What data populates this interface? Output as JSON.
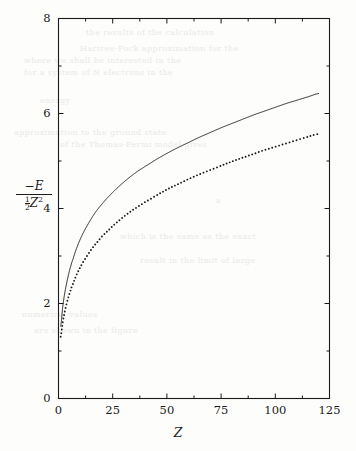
{
  "figure": {
    "background_color": "#fdfdfc",
    "ink_color": "#1a1a1a",
    "bleed_color": "#e9e9e6"
  },
  "axes": {
    "x_title": "Z",
    "y_title_numerator": "−E",
    "y_title_denominator_fraction_num": "1",
    "y_title_denominator_fraction_den": "2",
    "y_title_denominator_symbol": "Z",
    "y_title_denominator_exponent": "2",
    "x_tick_labels": [
      "0",
      "25",
      "50",
      "75",
      "100",
      "125"
    ],
    "y_tick_labels": [
      "0",
      "2",
      "4",
      "6",
      "8"
    ]
  },
  "bleed_text": [
    {
      "text": "the results of the calculation",
      "x": 86,
      "y": 28
    },
    {
      "text": "Hartree-Fock approximation for the",
      "x": 80,
      "y": 44
    },
    {
      "text": "where we shall be interested in the",
      "x": 24,
      "y": 56
    },
    {
      "text": "for a system of N electrons in the",
      "x": 24,
      "y": 68
    },
    {
      "text": "energy",
      "x": 40,
      "y": 96
    },
    {
      "text": "approximation to the ground state",
      "x": 14,
      "y": 128
    },
    {
      "text": "of the Thomas-Fermi model gives",
      "x": 60,
      "y": 140
    },
    {
      "text": "a",
      "x": 216,
      "y": 196
    },
    {
      "text": "which is the same as the exact",
      "x": 120,
      "y": 232
    },
    {
      "text": "result in the limit of large",
      "x": 140,
      "y": 256
    },
    {
      "text": "numerical values",
      "x": 22,
      "y": 310
    },
    {
      "text": "are shown in the figure",
      "x": 34,
      "y": 326
    }
  ],
  "chart_data": {
    "type": "line",
    "title": "",
    "xlabel": "Z",
    "ylabel": "-E / (1/2 Z^2)",
    "xlim": [
      0,
      125
    ],
    "ylim": [
      0,
      8
    ],
    "x_major_ticks": [
      0,
      25,
      50,
      75,
      100,
      125
    ],
    "y_major_ticks": [
      0,
      2,
      4,
      6,
      8
    ],
    "x_minor_ticks": [
      12.5,
      37.5,
      62.5,
      87.5,
      112.5
    ],
    "y_minor_ticks": [
      1,
      3,
      5,
      7
    ],
    "grid": false,
    "legend": "none",
    "series": [
      {
        "name": "Thomas-Fermi (solid)",
        "style": "solid",
        "x": [
          1,
          2,
          3,
          4,
          5,
          6,
          8,
          10,
          12,
          14,
          16,
          18,
          20,
          22,
          25,
          28,
          31,
          34,
          37,
          40,
          45,
          50,
          55,
          60,
          65,
          70,
          75,
          80,
          85,
          90,
          95,
          100,
          105,
          110,
          115,
          120
        ],
        "y": [
          1.52,
          1.95,
          2.25,
          2.48,
          2.68,
          2.85,
          3.12,
          3.35,
          3.54,
          3.7,
          3.85,
          3.98,
          4.09,
          4.2,
          4.34,
          4.47,
          4.59,
          4.7,
          4.8,
          4.89,
          5.03,
          5.16,
          5.28,
          5.39,
          5.5,
          5.6,
          5.7,
          5.79,
          5.88,
          5.97,
          6.05,
          6.13,
          6.21,
          6.28,
          6.35,
          6.42
        ]
      },
      {
        "name": "Hartree-Fock (dotted)",
        "style": "dotted",
        "x": [
          1,
          2,
          3,
          4,
          5,
          6,
          8,
          10,
          12,
          14,
          16,
          18,
          20,
          22,
          25,
          28,
          31,
          34,
          37,
          40,
          45,
          50,
          55,
          60,
          65,
          70,
          75,
          80,
          85,
          90,
          95,
          100,
          105,
          110,
          115,
          120
        ],
        "y": [
          1.3,
          1.62,
          1.85,
          2.04,
          2.2,
          2.34,
          2.57,
          2.76,
          2.92,
          3.06,
          3.19,
          3.3,
          3.41,
          3.5,
          3.63,
          3.75,
          3.86,
          3.96,
          4.05,
          4.14,
          4.27,
          4.4,
          4.51,
          4.62,
          4.72,
          4.81,
          4.9,
          4.99,
          5.07,
          5.15,
          5.23,
          5.3,
          5.37,
          5.44,
          5.51,
          5.57
        ]
      }
    ]
  }
}
